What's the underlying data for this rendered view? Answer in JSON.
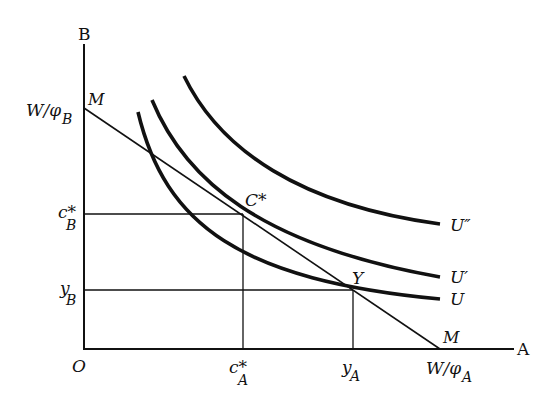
{
  "diagram": {
    "axes": {
      "x_label": "A",
      "y_label": "B",
      "origin": "O"
    },
    "budget_line": {
      "label_top": "M",
      "label_bottom": "M",
      "y_intercept": "W/φ",
      "y_intercept_sub": "B",
      "x_intercept": "W/φ",
      "x_intercept_sub": "A"
    },
    "curves": [
      {
        "label": "U″"
      },
      {
        "label": "U′"
      },
      {
        "label": "U"
      }
    ],
    "points": {
      "optimum": "C*",
      "endowment": "Y"
    },
    "y_ticks": [
      {
        "main": "c*",
        "sub": "B"
      },
      {
        "main": "y",
        "sub": "B"
      }
    ],
    "x_ticks": [
      {
        "main": "c*",
        "sub": "A"
      },
      {
        "main": "y",
        "sub": "A"
      }
    ]
  }
}
